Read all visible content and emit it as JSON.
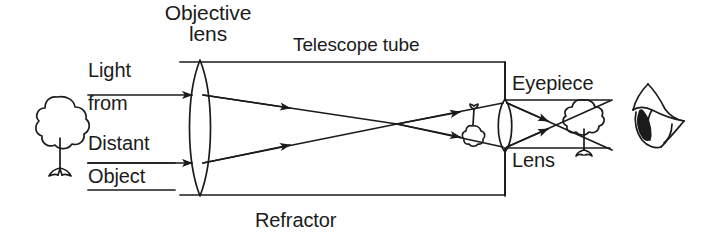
{
  "figure": {
    "caption": "Refractor",
    "title_implicit": "Refracting telescope ray diagram",
    "background_color": "#ffffff",
    "ink_color": "#1b1b1b"
  },
  "labels": {
    "objective_line1": "Objective",
    "objective_line2": "lens",
    "telescope_tube": "Telescope tube",
    "light": "Light",
    "from": "from",
    "distant": "Distant",
    "object": "Object",
    "eyepiece": "Eyepiece",
    "lens": "Lens",
    "refractor": "Refractor"
  },
  "icons": {
    "source_tree": "tree-icon",
    "inverted_image_tree": "inverted-tree-icon",
    "virtual_image_tree": "tree-icon",
    "eye": "eye-icon",
    "objective_lens": "convex-lens-icon",
    "eyepiece_lens": "convex-lens-icon",
    "ray_arrow": "arrowhead-icon"
  },
  "diagram_elements": [
    {
      "name": "source-tree",
      "role": "distant object",
      "x": 57,
      "y": 132
    },
    {
      "name": "objective-lens",
      "role": "converging lens",
      "x": 200,
      "y": 128
    },
    {
      "name": "telescope-tube",
      "role": "tube body",
      "x1": 180,
      "y1": 62,
      "x2": 505,
      "y2": 195
    },
    {
      "name": "focal-point",
      "role": "rays cross / real image plane",
      "x": 396,
      "y": 124
    },
    {
      "name": "inverted-image-tree",
      "role": "real inverted image",
      "x": 473,
      "y": 120
    },
    {
      "name": "eyepiece-lens",
      "role": "magnifying lens",
      "x": 505,
      "y": 124
    },
    {
      "name": "virtual-image-tree",
      "role": "magnified virtual image",
      "x": 582,
      "y": 126
    },
    {
      "name": "eye",
      "role": "observer",
      "x": 655,
      "y": 122
    }
  ]
}
